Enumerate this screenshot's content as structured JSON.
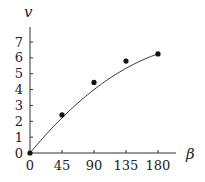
{
  "chart_data": {
    "type": "scatter",
    "title": "",
    "xlabel": "β",
    "ylabel": "v",
    "x": [
      0,
      45,
      90,
      135,
      180
    ],
    "values": [
      0,
      2.4,
      4.45,
      5.8,
      6.25
    ],
    "xticks": [
      "0",
      "45",
      "90",
      "135",
      "180"
    ],
    "yticks": [
      "0",
      "1",
      "2",
      "3",
      "4",
      "5",
      "6",
      "7"
    ],
    "xlim": [
      0,
      200
    ],
    "ylim": [
      0,
      8.5
    ],
    "grid": false,
    "fit_curve": true
  }
}
